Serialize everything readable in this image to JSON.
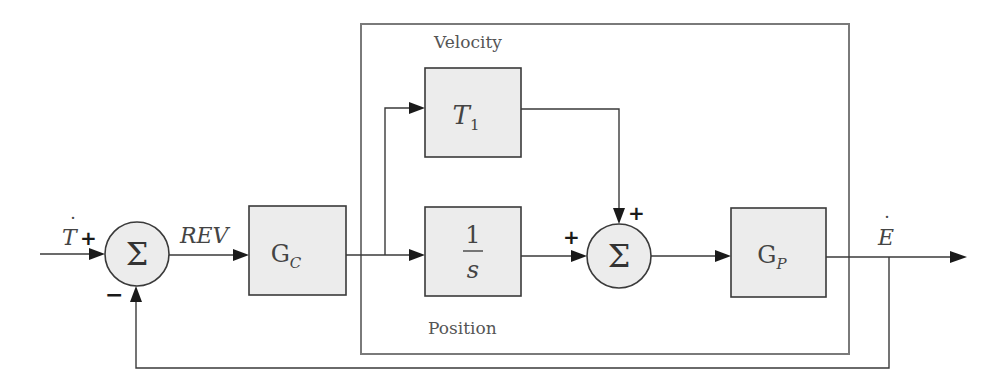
{
  "diagram": {
    "title": "",
    "frame": {
      "top_label": "Velocity",
      "bottom_label": "Position"
    },
    "input_signal": {
      "symbol": "T",
      "dot": "˙",
      "sign": "+"
    },
    "feedback_sign": "−",
    "error_signal": "REV",
    "sum1": {
      "symbol": "Σ"
    },
    "controller": {
      "main": "G",
      "sub": "C"
    },
    "velocity_block": {
      "main": "T",
      "sub": "1"
    },
    "integrator": {
      "numerator": "1",
      "denominator": "s"
    },
    "sum2": {
      "symbol": "Σ",
      "sign_top": "+",
      "sign_left": "+"
    },
    "plant": {
      "main": "G",
      "sub": "P"
    },
    "output_signal": {
      "symbol": "E",
      "dot": "˙"
    }
  },
  "colors": {
    "block_fill": "#ececec",
    "line": "#3a3a3a",
    "frame": "#7a7a7a"
  }
}
